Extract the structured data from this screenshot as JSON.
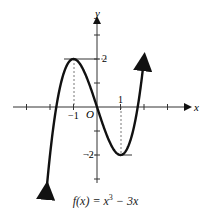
{
  "chart_data": {
    "type": "line",
    "function": "x^3 - 3x",
    "xlabel": "x",
    "ylabel": "y",
    "origin_label": "O",
    "xlim": [
      -3.6,
      3.9
    ],
    "ylim": [
      -3.4,
      3.9
    ],
    "x_tick_labels": [
      {
        "x": -1,
        "label": "−1"
      },
      {
        "x": 1,
        "label": "1"
      }
    ],
    "y_tick_labels": [
      {
        "y": 2,
        "label": "2"
      },
      {
        "y": -2,
        "label": "−2"
      }
    ],
    "x_ticks": [
      -3,
      -2,
      -1,
      1,
      2,
      3
    ],
    "y_ticks": [
      -3,
      -2,
      -1,
      1,
      2,
      3
    ],
    "grid": false,
    "critical_points": [
      {
        "x": -1,
        "y": 2,
        "type": "local max"
      },
      {
        "x": 1,
        "y": -2,
        "type": "local min"
      }
    ],
    "x": [
      -2.4,
      -2,
      -1.5,
      -1,
      -0.5,
      0,
      0.5,
      1,
      1.5,
      2,
      2.2
    ],
    "values": [
      -6.62,
      -2,
      1.125,
      2,
      1.375,
      0,
      -1.375,
      -2,
      -1.125,
      2,
      4.05
    ]
  },
  "labels": {
    "x_axis": "x",
    "y_axis": "y",
    "origin": "O",
    "tick_x_neg1": "−1",
    "tick_x_1": "1",
    "tick_y_2": "2",
    "tick_y_neg2": "−2",
    "caption_prefix": "f(x) = x",
    "caption_exp": "3",
    "caption_suffix": " − 3x"
  }
}
